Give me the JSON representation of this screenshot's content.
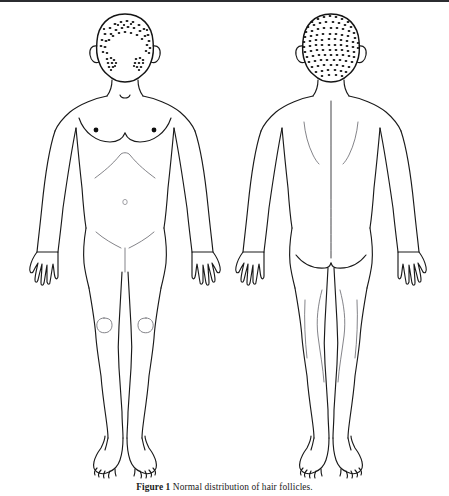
{
  "figure": {
    "caption_number": "Figure 1",
    "caption_text": "Normal distribution of hair follicles.",
    "caption_full": "Figure 1 Normal distribution of hair follicles.",
    "background_color": "#ffffff",
    "line_color": "#1a1a1a",
    "stipple_color": "#141414",
    "faint_line_color": "#6e6e74"
  },
  "views": {
    "anterior": {
      "label": "anterior-body-view",
      "regions": [
        {
          "name": "scalp-hairline-stipple",
          "density": "sparse-band"
        },
        {
          "name": "left-cheek-beard-patch",
          "density": "sparse-cluster"
        },
        {
          "name": "right-cheek-beard-patch",
          "density": "sparse-cluster"
        },
        {
          "name": "left-nipple",
          "density": "solid-dot"
        },
        {
          "name": "right-nipple",
          "density": "solid-dot"
        },
        {
          "name": "navel",
          "density": "open-dot"
        },
        {
          "name": "left-patella",
          "density": "outline"
        },
        {
          "name": "right-patella",
          "density": "outline"
        }
      ]
    },
    "posterior": {
      "label": "posterior-body-view",
      "regions": [
        {
          "name": "occipital-scalp-stipple",
          "density": "dense-full"
        },
        {
          "name": "spine-midline",
          "density": "line"
        },
        {
          "name": "left-scapula",
          "density": "line"
        },
        {
          "name": "right-scapula",
          "density": "line"
        },
        {
          "name": "gluteal-crease",
          "density": "line"
        }
      ]
    }
  }
}
